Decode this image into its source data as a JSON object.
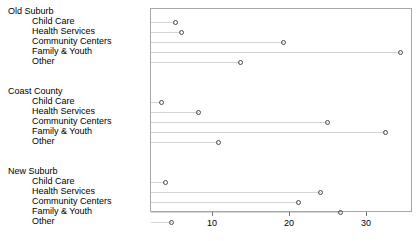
{
  "chart_data": {
    "type": "scatter",
    "title": "",
    "xlabel": "",
    "ylabel": "",
    "xlim": [
      0,
      36
    ],
    "xticks": [
      10,
      20,
      30
    ],
    "xticklabels": [
      "10",
      "20",
      "30"
    ],
    "grid": true,
    "legend": "none",
    "panel_label_order": "top-to-bottom",
    "groups": [
      {
        "name": "Old Suburb",
        "categories": [
          "Child Care",
          "Health Services",
          "Community Centers",
          "Family & Youth",
          "Other"
        ],
        "values": [
          5.2,
          6.0,
          19.3,
          34.5,
          13.7
        ]
      },
      {
        "name": "Coast County",
        "categories": [
          "Child Care",
          "Health Services",
          "Community Centers",
          "Family & Youth",
          "Other"
        ],
        "values": [
          3.4,
          8.3,
          25.0,
          32.5,
          10.8
        ]
      },
      {
        "name": "New Suburb",
        "categories": [
          "Child Care",
          "Health Services",
          "Community Centers",
          "Family & Youth",
          "Other"
        ],
        "values": [
          3.9,
          24.1,
          21.2,
          26.7,
          4.8
        ]
      }
    ]
  },
  "style": {
    "point_stroke": "#4a4a4a",
    "line_color": "#d4d4d4",
    "panel_border": "#a8a8a8",
    "text_color": "#000000"
  }
}
